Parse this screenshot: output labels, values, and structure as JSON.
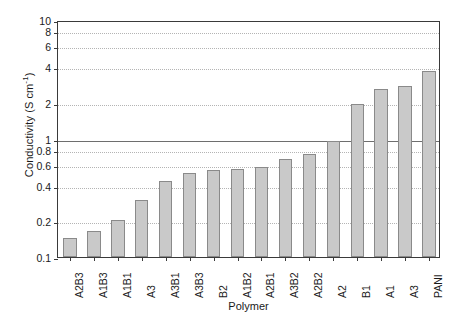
{
  "chart_data": {
    "type": "bar",
    "title": "",
    "xlabel": "Polymer",
    "ylabel": "Conductivity (S cm",
    "ylabel_sup": "-1",
    "ylabel_tail": ")",
    "yscale": "log",
    "ylim": [
      0.1,
      10
    ],
    "grid": true,
    "legend": "none",
    "categories": [
      "A2B3",
      "A1B3",
      "A1B1",
      "A3",
      "A3B1",
      "A3B3",
      "B2",
      "A1B2",
      "A2B1",
      "A3B2",
      "A2B2",
      "A2",
      "B1",
      "A1",
      "A3",
      "PANI"
    ],
    "values": [
      0.145,
      0.165,
      0.205,
      0.305,
      0.44,
      0.51,
      0.545,
      0.555,
      0.575,
      0.675,
      0.74,
      0.95,
      1.95,
      2.6,
      2.8,
      3.7
    ],
    "ytick_values": [
      0.1,
      0.2,
      0.4,
      0.6,
      0.8,
      1,
      2,
      4,
      6,
      8,
      10
    ],
    "ytick_labels": [
      "0.1",
      "0.2",
      "0.4",
      "0.6",
      "0.8",
      "1",
      "2",
      "4",
      "6",
      "8",
      "10"
    ],
    "major_gridlines": [
      1,
      10
    ],
    "bar_color": "#c9c9c9",
    "bar_edge_color": "#8a8a8a",
    "axis_color": "#3a3a3a",
    "grid_color": "#b4b4b4"
  }
}
